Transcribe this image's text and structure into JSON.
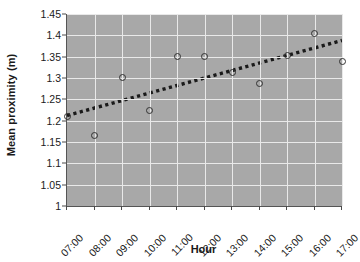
{
  "chart_data": {
    "type": "scatter",
    "title": "",
    "xlabel": "Hour",
    "ylabel": "Mean proximity (m)",
    "categories": [
      "07:00",
      "08:00",
      "09:00",
      "10:00",
      "11:00",
      "12:00",
      "13:00",
      "14:00",
      "15:00",
      "16:00",
      "17:00"
    ],
    "x_tick_labels": [
      "07:00",
      "08:00",
      "09:00",
      "10:00",
      "11:00",
      "12:00",
      "13:00",
      "14:00",
      "15:00",
      "16:00",
      "17:00"
    ],
    "y_tick_labels": [
      "1.45",
      "1.4",
      "1.35",
      "1.3",
      "1.25",
      "1.2",
      "1.15",
      "1.1",
      "1.05",
      "1"
    ],
    "y_tick_values": [
      1.45,
      1.4,
      1.35,
      1.3,
      1.25,
      1.2,
      1.15,
      1.1,
      1.05,
      1.0
    ],
    "ylim": [
      1.0,
      1.45
    ],
    "xlim": [
      0,
      10
    ],
    "values": [
      1.21,
      1.166,
      1.302,
      1.223,
      1.351,
      1.351,
      1.312,
      1.288,
      1.352,
      1.404,
      1.338
    ],
    "series": [
      {
        "name": "Mean proximity",
        "marker": "open-circle",
        "color": "#333333",
        "points": [
          {
            "x_label": "07:00",
            "x": 0,
            "y": 1.21
          },
          {
            "x_label": "08:00",
            "x": 1,
            "y": 1.166
          },
          {
            "x_label": "09:00",
            "x": 2,
            "y": 1.302
          },
          {
            "x_label": "10:00",
            "x": 3,
            "y": 1.223
          },
          {
            "x_label": "11:00",
            "x": 4,
            "y": 1.351
          },
          {
            "x_label": "12:00",
            "x": 5,
            "y": 1.351
          },
          {
            "x_label": "13:00",
            "x": 6,
            "y": 1.312
          },
          {
            "x_label": "14:00",
            "x": 7,
            "y": 1.288
          },
          {
            "x_label": "15:00",
            "x": 8,
            "y": 1.352
          },
          {
            "x_label": "16:00",
            "x": 9,
            "y": 1.404
          },
          {
            "x_label": "17:00",
            "x": 10,
            "y": 1.338
          }
        ]
      }
    ],
    "trendline": {
      "style": "dotted",
      "color": "#1a1a1a",
      "x_start": 0,
      "y_start": 1.212,
      "x_end": 10,
      "y_end": 1.388
    },
    "grid": true,
    "grid_color": "#e9e9e9",
    "plot_background": "#a8a8a8",
    "figure_background": "#ffffff",
    "legend": null,
    "legend_position": "none"
  },
  "axis": {
    "y_title": "Mean proximity (m)",
    "x_title": "Hour"
  }
}
